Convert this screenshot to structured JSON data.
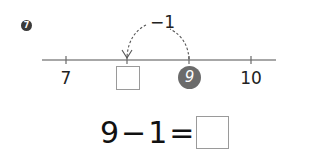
{
  "problem": {
    "number": "7"
  },
  "number_line": {
    "ticks": [
      {
        "label": "7",
        "x": 66,
        "type": "number"
      },
      {
        "label": "",
        "x": 127,
        "type": "blank-box"
      },
      {
        "label": "9",
        "x": 189,
        "type": "highlighted-circle"
      },
      {
        "label": "10",
        "x": 251,
        "type": "number"
      }
    ],
    "jump": {
      "label": "−1",
      "from": "9",
      "direction": "left"
    },
    "line_color": "#8a8a8a",
    "highlight_color": "#6b6b6b"
  },
  "equation": {
    "left_operand": "9",
    "operator": "−",
    "right_operand": "1",
    "equals": "=",
    "answer": ""
  }
}
